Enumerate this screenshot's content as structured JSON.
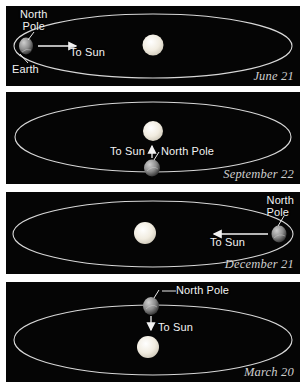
{
  "figure": {
    "background_color": "#ffffff",
    "panel_background": "#050505",
    "orbit_color": "#d8d8d8",
    "sun_color": "#f0ece0",
    "label_color": "#f2f2f2",
    "date_color": "#cfcfcf"
  },
  "panels": [
    {
      "id": "june",
      "date": "June 21",
      "earth_position": "left",
      "sun_label": "To Sun",
      "arrow_direction": "right",
      "labels": {
        "north_pole": "North\nPole",
        "earth": "Earth"
      }
    },
    {
      "id": "september",
      "date": "September 22",
      "earth_position": "bottom",
      "sun_label": "To Sun",
      "arrow_direction": "up",
      "labels": {
        "north_pole": "North Pole"
      }
    },
    {
      "id": "december",
      "date": "December 21",
      "earth_position": "right",
      "sun_label": "To Sun",
      "arrow_direction": "left",
      "labels": {
        "north_pole": "North\nPole"
      }
    },
    {
      "id": "march",
      "date": "March 20",
      "earth_position": "top",
      "sun_label": "To Sun",
      "arrow_direction": "down",
      "labels": {
        "north_pole": "North Pole"
      }
    }
  ]
}
